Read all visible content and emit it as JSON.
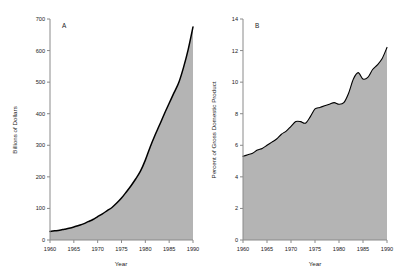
{
  "figure": {
    "background_color": "#ffffff",
    "fill_color": "#b4b4b4",
    "line_color": "#000000",
    "axis_color": "#808080",
    "text_color": "#1a1a1a"
  },
  "panels": [
    {
      "letter": "A",
      "chart_data": {
        "type": "area",
        "title": "",
        "xlabel": "Year",
        "ylabel": "Billions of Dollars",
        "xlim": [
          1960,
          1990
        ],
        "ylim": [
          0,
          700
        ],
        "xticks": [
          1960,
          1965,
          1970,
          1975,
          1980,
          1985,
          1990
        ],
        "xtick_labels": [
          "1960",
          "1965",
          "1970",
          "1975",
          "1980",
          "1985",
          "1990"
        ],
        "yticks": [
          0,
          100,
          200,
          300,
          400,
          500,
          600,
          700
        ],
        "ytick_labels": [
          "0",
          "100",
          "200",
          "300",
          "400",
          "500",
          "600",
          "700"
        ],
        "grid": false,
        "legend": "none",
        "x": [
          1960,
          1961,
          1962,
          1963,
          1964,
          1965,
          1966,
          1967,
          1968,
          1969,
          1970,
          1971,
          1972,
          1973,
          1974,
          1975,
          1976,
          1977,
          1978,
          1979,
          1980,
          1981,
          1982,
          1983,
          1984,
          1985,
          1986,
          1987,
          1988,
          1989,
          1990
        ],
        "values": [
          27,
          29,
          31,
          34,
          37,
          41,
          46,
          51,
          58,
          65,
          74,
          83,
          93,
          103,
          117,
          133,
          152,
          172,
          194,
          219,
          253,
          294,
          331,
          365,
          400,
          433,
          466,
          498,
          546,
          604,
          675
        ]
      }
    },
    {
      "letter": "B",
      "chart_data": {
        "type": "area",
        "title": "",
        "xlabel": "Year",
        "ylabel": "Percent of Gross Domestic Product",
        "xlim": [
          1960,
          1990
        ],
        "ylim": [
          0,
          14
        ],
        "xticks": [
          1960,
          1965,
          1970,
          1975,
          1980,
          1985,
          1990
        ],
        "xtick_labels": [
          "1960",
          "1965",
          "1970",
          "1975",
          "1980",
          "1985",
          "1990"
        ],
        "yticks": [
          0,
          2,
          4,
          6,
          8,
          10,
          12,
          14
        ],
        "ytick_labels": [
          "0",
          "2",
          "4",
          "6",
          "8",
          "10",
          "12",
          "14"
        ],
        "grid": false,
        "legend": "none",
        "x": [
          1960,
          1961,
          1962,
          1963,
          1964,
          1965,
          1966,
          1967,
          1968,
          1969,
          1970,
          1971,
          1972,
          1973,
          1974,
          1975,
          1976,
          1977,
          1978,
          1979,
          1980,
          1981,
          1982,
          1983,
          1984,
          1985,
          1986,
          1987,
          1988,
          1989,
          1990
        ],
        "values": [
          5.3,
          5.4,
          5.5,
          5.7,
          5.8,
          6.0,
          6.2,
          6.4,
          6.7,
          6.9,
          7.2,
          7.5,
          7.5,
          7.4,
          7.8,
          8.3,
          8.4,
          8.5,
          8.6,
          8.7,
          8.6,
          8.7,
          9.3,
          10.2,
          10.6,
          10.2,
          10.3,
          10.8,
          11.1,
          11.5,
          12.2
        ]
      }
    }
  ]
}
